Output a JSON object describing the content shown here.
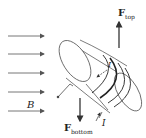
{
  "diagram": {
    "field_label": "B",
    "current_label_inner": "I",
    "current_label_lead": "I",
    "force_top": {
      "symbol": "F",
      "subscript": "top"
    },
    "force_bottom": {
      "symbol": "F",
      "subscript": "bottom"
    },
    "field_arrow_count": 5,
    "colors": {
      "stroke": "#333333",
      "text": "#222222"
    }
  }
}
